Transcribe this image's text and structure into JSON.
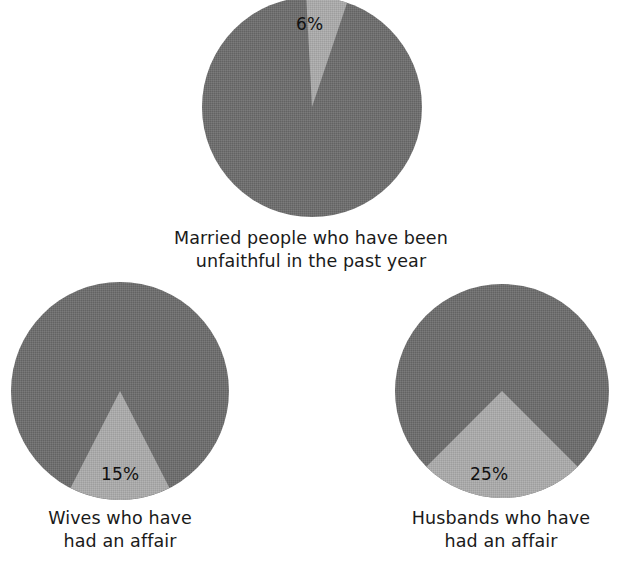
{
  "chart_data": [
    {
      "type": "pie",
      "id": "married",
      "title": "Married people who have been unfaithful in the past year",
      "caption_lines": [
        "Married people who have been",
        "unfaithful in the past year"
      ],
      "categories": [
        "Unfaithful",
        "Faithful"
      ],
      "values": [
        6,
        94
      ],
      "labels": [
        "6%",
        ""
      ],
      "highlight_label": "6%",
      "highlight_value": 6,
      "start_angle_deg": -3,
      "highlight_sweep_deg": 21.6,
      "colors": [
        "#a9a9a9",
        "#6f6f6f"
      ],
      "legend": false,
      "grid": false
    },
    {
      "type": "pie",
      "id": "wives",
      "title": "Wives who have had an affair",
      "caption_lines": [
        "Wives who have",
        "had an affair"
      ],
      "categories": [
        "Had an affair",
        "Did not"
      ],
      "values": [
        15,
        85
      ],
      "labels": [
        "15%",
        ""
      ],
      "highlight_label": "15%",
      "highlight_value": 15,
      "start_angle_deg": 153,
      "highlight_sweep_deg": 54,
      "colors": [
        "#a9a9a9",
        "#6f6f6f"
      ],
      "legend": false,
      "grid": false
    },
    {
      "type": "pie",
      "id": "husbands",
      "title": "Husbands who have had an affair",
      "caption_lines": [
        "Husbands who have",
        "had an affair"
      ],
      "categories": [
        "Had an affair",
        "Did not"
      ],
      "values": [
        25,
        75
      ],
      "labels": [
        "25%",
        ""
      ],
      "highlight_label": "25%",
      "highlight_value": 25,
      "start_angle_deg": 135,
      "highlight_sweep_deg": 90,
      "colors": [
        "#a9a9a9",
        "#6f6f6f"
      ],
      "legend": false,
      "grid": false
    }
  ],
  "figure": {
    "background": "#ffffff",
    "base_color": "#6f6f6f",
    "highlight_color": "#a9a9a9",
    "text_color": "#1a1a1a"
  },
  "married": {
    "slice_label": "6%",
    "caption_line1": "Married people who have been",
    "caption_line2": "unfaithful in the past year",
    "caption": "Married people who have been\nunfaithful in the past year"
  },
  "wives": {
    "slice_label": "15%",
    "caption_line1": "Wives who have",
    "caption_line2": "had an affair",
    "caption": "Wives who have\nhad an affair"
  },
  "husbands": {
    "slice_label": "25%",
    "caption_line1": "Husbands who have",
    "caption_line2": "had an affair",
    "caption": "Husbands who have\nhad an affair"
  }
}
